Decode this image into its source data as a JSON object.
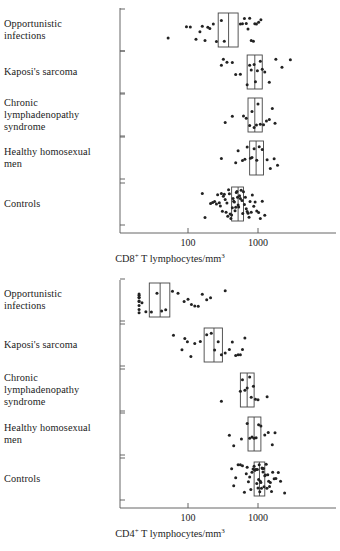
{
  "figure": {
    "dot_color": "#222222",
    "axis_color": "#555555",
    "box_color": "#444444"
  },
  "panels": [
    {
      "id": "top",
      "axis_title_main": "CD8",
      "axis_title_sup": "+",
      "axis_title_rest": " T lymphocytes/mm",
      "axis_title_sup2": "3",
      "categories": [
        "Opportunistic\ninfections",
        "Kaposi's sarcoma",
        "Chronic\nlymphadenopathy\nsyndrome",
        "Healthy homosexual\nmen",
        "Controls"
      ],
      "tick_labels": [
        "100",
        "1000"
      ]
    },
    {
      "id": "bottom",
      "axis_title_main": "CD4",
      "axis_title_sup": "+",
      "axis_title_rest": " T lymphocytes/mm",
      "axis_title_sup2": "3",
      "categories": [
        "Opportunistic\ninfections",
        "Kaposi's sarcoma",
        "Chronic\nlymphadenopathy\nsyndrome",
        "Healthy homosexual\nmen",
        "Controls"
      ],
      "tick_labels": [
        "100",
        "1000"
      ]
    }
  ],
  "chart_data": [
    {
      "type": "scatter",
      "id": "cd8-panel",
      "title": "",
      "xlabel": "CD8+ T lymphocytes/mm3",
      "ylabel": "",
      "xscale": "log",
      "xlim": [
        20,
        4000
      ],
      "xticks": [
        100,
        1000
      ],
      "grid": false,
      "legend": "none",
      "categories": [
        "Opportunistic infections",
        "Kaposi's sarcoma",
        "Chronic lymphadenopathy syndrome",
        "Healthy homosexual men",
        "Controls"
      ],
      "series": [
        {
          "name": "Opportunistic infections",
          "box": {
            "q1": 270,
            "median": 380,
            "q3": 520
          },
          "values": [
            52,
            95,
            108,
            130,
            148,
            160,
            175,
            192,
            205,
            230,
            255,
            300,
            330,
            560,
            600,
            640,
            680,
            720,
            760,
            800,
            860,
            900,
            950,
            1020,
            1100
          ]
        },
        {
          "name": "Kaposi's sarcoma",
          "box": {
            "q1": 700,
            "median": 900,
            "q3": 1150
          },
          "values": [
            300,
            320,
            360,
            430,
            480,
            560,
            700,
            760,
            800,
            880,
            920,
            980,
            1080,
            1150,
            1250,
            1450,
            1800,
            2200,
            2900
          ]
        },
        {
          "name": "Chronic lymphadenopathy syndrome",
          "box": {
            "q1": 720,
            "median": 900,
            "q3": 1150
          },
          "values": [
            340,
            430,
            620,
            680,
            760,
            820,
            880,
            950,
            1000,
            1080,
            1200,
            1320,
            1450,
            1600,
            1750
          ]
        },
        {
          "name": "Healthy homosexual men",
          "box": {
            "q1": 760,
            "median": 940,
            "q3": 1200
          },
          "values": [
            300,
            480,
            520,
            600,
            650,
            700,
            780,
            820,
            880,
            960,
            1040,
            1150,
            1350,
            1500,
            1700,
            1900
          ]
        },
        {
          "name": "Controls",
          "box": {
            "q1": 420,
            "median": 520,
            "q3": 620
          },
          "values": [
            160,
            175,
            210,
            225,
            240,
            255,
            265,
            280,
            290,
            300,
            310,
            320,
            330,
            340,
            350,
            360,
            370,
            380,
            390,
            400,
            410,
            420,
            430,
            440,
            450,
            460,
            470,
            480,
            490,
            500,
            510,
            520,
            530,
            545,
            560,
            575,
            590,
            605,
            620,
            640,
            660,
            680,
            700,
            720,
            745,
            770,
            800,
            830,
            870,
            910,
            960,
            1020,
            1080,
            1150,
            1250
          ]
        }
      ]
    },
    {
      "type": "scatter",
      "id": "cd4-panel",
      "title": "",
      "xlabel": "CD4+ T lymphocytes/mm3",
      "ylabel": "",
      "xscale": "log",
      "xlim": [
        20,
        4000
      ],
      "xticks": [
        100,
        1000
      ],
      "grid": false,
      "legend": "none",
      "categories": [
        "Opportunistic infections",
        "Kaposi's sarcoma",
        "Chronic lymphadenopathy syndrome",
        "Healthy homosexual men",
        "Controls"
      ],
      "series": [
        {
          "name": "Opportunistic infections",
          "box": {
            "q1": 28,
            "median": 40,
            "q3": 55
          },
          "values": [
            20,
            20,
            20,
            20,
            20,
            20,
            20,
            20,
            20,
            22,
            25,
            30,
            36,
            42,
            48,
            60,
            72,
            88,
            100,
            112,
            125,
            140,
            160,
            185,
            210,
            340
          ]
        },
        {
          "name": "Kaposi's sarcoma",
          "box": {
            "q1": 170,
            "median": 235,
            "q3": 310
          },
          "values": [
            62,
            82,
            90,
            98,
            110,
            125,
            150,
            185,
            215,
            240,
            270,
            300,
            340,
            390,
            430,
            480,
            520,
            560,
            600,
            650
          ]
        },
        {
          "name": "Chronic lymphadenopathy syndrome",
          "box": {
            "q1": 560,
            "median": 700,
            "q3": 880
          },
          "values": [
            300,
            560,
            600,
            650,
            700,
            760,
            800,
            860,
            920,
            1000,
            1350
          ]
        },
        {
          "name": "Healthy homosexual men",
          "box": {
            "q1": 720,
            "median": 880,
            "q3": 1100
          },
          "values": [
            390,
            450,
            580,
            700,
            760,
            820,
            880,
            940,
            1020,
            1100,
            1250,
            1400,
            1600,
            1750
          ]
        },
        {
          "name": "Controls",
          "box": {
            "q1": 880,
            "median": 1050,
            "q3": 1250
          },
          "values": [
            420,
            450,
            480,
            520,
            560,
            600,
            640,
            680,
            700,
            730,
            760,
            790,
            820,
            850,
            880,
            900,
            920,
            940,
            960,
            980,
            1000,
            1020,
            1040,
            1060,
            1080,
            1100,
            1120,
            1140,
            1160,
            1180,
            1200,
            1220,
            1250,
            1280,
            1310,
            1340,
            1380,
            1420,
            1460,
            1500,
            1560,
            1620,
            1700,
            1800,
            1950,
            2100,
            2400
          ]
        }
      ]
    }
  ]
}
